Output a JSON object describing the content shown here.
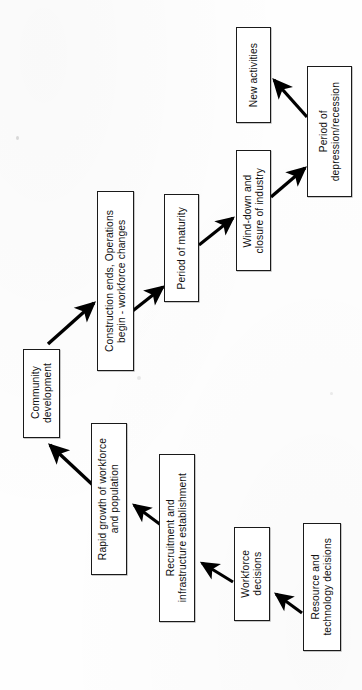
{
  "diagram": {
    "type": "flowchart",
    "orientation": "rotated-90-ccw",
    "colors": {
      "background": "#fefefe",
      "box_fill": "#ffffff",
      "box_stroke": "#1a1a1a",
      "arrow": "#000000",
      "text": "#111111"
    },
    "nodes": [
      {
        "id": "new-activities",
        "label": "New activities",
        "x": 236,
        "y": 27,
        "w": 35,
        "h": 96
      },
      {
        "id": "period-of-depression-recession",
        "label": "Period of\ndepression/recession",
        "x": 307,
        "y": 66,
        "w": 45,
        "h": 131
      },
      {
        "id": "wind-down-and-closure-of-industry",
        "label": "Wind-down and\nclosure of industry",
        "x": 236,
        "y": 150,
        "w": 35,
        "h": 121
      },
      {
        "id": "period-of-maturity",
        "label": "Period of maturity",
        "x": 164,
        "y": 194,
        "w": 35,
        "h": 108
      },
      {
        "id": "construction-ends-operations-begin",
        "label": "Construction ends, Operations\nbegin - workforce changes",
        "x": 97,
        "y": 191,
        "w": 37,
        "h": 180
      },
      {
        "id": "community-development",
        "label": "Community\ndevelopment",
        "x": 23,
        "y": 349,
        "w": 37,
        "h": 89
      },
      {
        "id": "rapid-growth-of-workforce-and-population",
        "label": "Rapid growth of workforce\nand population",
        "x": 91,
        "y": 423,
        "w": 36,
        "h": 152
      },
      {
        "id": "recruitment-and-infrastructure-establishment",
        "label": "Recruitment and\ninfrastructure establishment",
        "x": 159,
        "y": 454,
        "w": 36,
        "h": 168
      },
      {
        "id": "workforce-decisions",
        "label": "Workforce\ndecisions",
        "x": 234,
        "y": 527,
        "w": 36,
        "h": 94
      },
      {
        "id": "resource-and-technology-decisions",
        "label": "Resource and\ntechnology decisions",
        "x": 303,
        "y": 523,
        "w": 38,
        "h": 128
      }
    ],
    "edges": [
      {
        "id": "edge-resource-to-workforce",
        "from": "resource-and-technology-decisions",
        "to": "workforce-decisions"
      },
      {
        "id": "edge-workforce-to-recruitment",
        "from": "workforce-decisions",
        "to": "recruitment-and-infrastructure-establishment"
      },
      {
        "id": "edge-recruitment-to-rapidgrowth",
        "from": "recruitment-and-infrastructure-establishment",
        "to": "rapid-growth-of-workforce-and-population"
      },
      {
        "id": "edge-rapidgrowth-to-community",
        "from": "rapid-growth-of-workforce-and-population",
        "to": "community-development"
      },
      {
        "id": "edge-community-to-construction",
        "from": "community-development",
        "to": "construction-ends-operations-begin"
      },
      {
        "id": "edge-construction-to-maturity",
        "from": "construction-ends-operations-begin",
        "to": "period-of-maturity"
      },
      {
        "id": "edge-maturity-to-winddown",
        "from": "period-of-maturity",
        "to": "wind-down-and-closure-of-industry"
      },
      {
        "id": "edge-winddown-to-depression",
        "from": "wind-down-and-closure-of-industry",
        "to": "period-of-depression-recession"
      },
      {
        "id": "edge-depression-to-newactivities",
        "from": "period-of-depression-recession",
        "to": "new-activities"
      }
    ]
  }
}
